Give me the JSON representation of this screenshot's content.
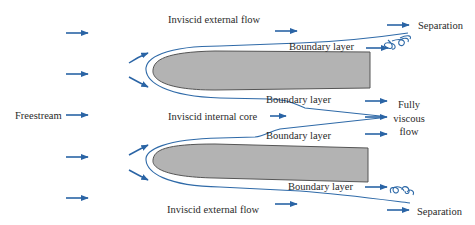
{
  "figure": {
    "type": "flow-between-plates-schematic",
    "colors": {
      "flow_line": "#2f6aa8",
      "arrow": "#2a64a5",
      "plate_fill": "#b3b3b3",
      "plate_stroke": "#555555",
      "text": "#2a2a2a",
      "background": "#ffffff"
    },
    "labels": {
      "top_external": "Inviscid external flow",
      "top_separation": "Separation",
      "top_boundary_outer": "Boundary layer",
      "top_boundary_inner": "Boundary layer",
      "freestream": "Freestream",
      "internal_core": "Inviscid internal core",
      "bottom_boundary_inner": "Boundary layer",
      "fully_viscous_1": "Fully",
      "fully_viscous_2": "viscous",
      "fully_viscous_3": "flow",
      "bottom_boundary_outer": "Boundary layer",
      "bottom_external": "Inviscid external flow",
      "bottom_separation": "Separation"
    }
  }
}
